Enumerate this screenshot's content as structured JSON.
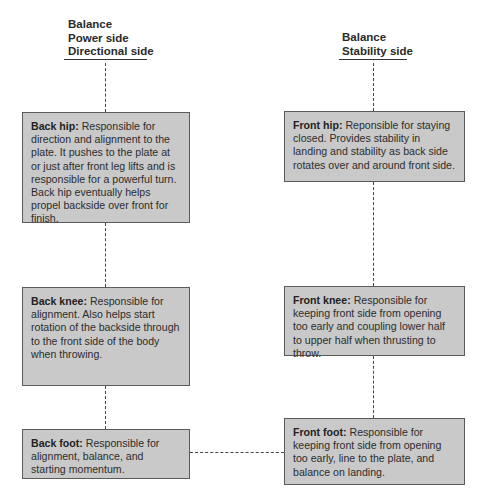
{
  "diagram": {
    "left_column": {
      "header": [
        "Balance",
        "Power side",
        "Directional side"
      ],
      "boxes": [
        {
          "title": "Back hip:",
          "text": "Responsible for direction and alignment to the plate. It pushes to the plate at or just after front leg lifts and is responsible for a powerful turn. Back hip eventually helps propel backside over front for finish."
        },
        {
          "title": "Back knee:",
          "text": "Responsible for alignment. Also helps start rotation of the backside through to the front side of the body when throwing."
        },
        {
          "title": "Back foot:",
          "text": "Responsible for alignment, balance, and starting momentum."
        }
      ]
    },
    "right_column": {
      "header": [
        "Balance",
        "Stability side"
      ],
      "boxes": [
        {
          "title": "Front hip:",
          "text": "Reponsible for staying closed. Provides stability in landing and stability as back side rotates over and around front side."
        },
        {
          "title": "Front knee:",
          "text": "Responsible for keeping front side from opening too early and coupling lower half to upper half when thrusting to throw."
        },
        {
          "title": "Front foot:",
          "text": "Responsible for keeping front side from opening too early, line to the plate, and balance on landing."
        }
      ]
    },
    "colors": {
      "box_fill": "#c9c9c9",
      "box_border": "#5a5a5a",
      "line": "#444444"
    }
  }
}
